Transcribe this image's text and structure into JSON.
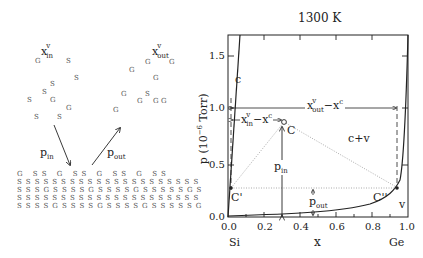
{
  "left_panel": {
    "x_in_label": {
      "base": "x",
      "sup": "v",
      "sub": "in"
    },
    "x_out_label": {
      "base": "x",
      "sup": "v",
      "sub": "out"
    },
    "p_in_label": {
      "base": "p",
      "sub": "in"
    },
    "p_out_label": {
      "base": "p",
      "sub": "out"
    },
    "vapor_in_atoms": [
      {
        "t": "G",
        "x": 35,
        "y": 57
      },
      {
        "t": "S",
        "x": 66,
        "y": 57
      },
      {
        "t": "S",
        "x": 74,
        "y": 74
      },
      {
        "t": "S",
        "x": 50,
        "y": 80
      },
      {
        "t": "S",
        "x": 42,
        "y": 88
      },
      {
        "t": "S",
        "x": 27,
        "y": 96
      },
      {
        "t": "G",
        "x": 50,
        "y": 96
      },
      {
        "t": "G",
        "x": 66,
        "y": 104
      },
      {
        "t": "S",
        "x": 34,
        "y": 113
      },
      {
        "t": "S",
        "x": 57,
        "y": 113
      }
    ],
    "vapor_out_atoms": [
      {
        "t": "G",
        "x": 145,
        "y": 58
      },
      {
        "t": "G",
        "x": 169,
        "y": 58
      },
      {
        "t": "G",
        "x": 129,
        "y": 66
      },
      {
        "t": "G",
        "x": 153,
        "y": 74
      },
      {
        "t": "G",
        "x": 121,
        "y": 90
      },
      {
        "t": "S",
        "x": 145,
        "y": 90
      },
      {
        "t": "G",
        "x": 137,
        "y": 97
      },
      {
        "t": "G",
        "x": 153,
        "y": 97
      },
      {
        "t": "G",
        "x": 161,
        "y": 97
      },
      {
        "t": "G",
        "x": 113,
        "y": 106
      }
    ],
    "lattice_rows": [
      "G   S S   G   S S   G   S S   G   S S",
      "S S S S S S S S S S S S S S S S S S S S S",
      "S S S G S S S S G S S S S G S S S S S G S",
      "S S S S S S S S S S S S S S S S S S S S S",
      "S S S S G S S S S G S S S S G S S S S S G"
    ]
  },
  "chart_data": {
    "type": "line",
    "title": "1300 K",
    "xlabel": "x",
    "ylabel": "p (10⁻⁶ Torr)",
    "xlim": [
      0.0,
      1.0
    ],
    "ylim": [
      0.0,
      1.7
    ],
    "x_ticks": [
      "0.0",
      "0.2",
      "0.4",
      "0.6",
      "0.8",
      "1.0"
    ],
    "y_ticks": [
      "0.0",
      "0.5",
      "1.0",
      "1.5"
    ],
    "x_end_labels": {
      "left": "Si",
      "right": "Ge"
    },
    "series": [
      {
        "name": "c (solidus)",
        "points": [
          [
            0.0,
            0.0
          ],
          [
            0.02,
            0.5
          ],
          [
            0.04,
            1.0
          ],
          [
            0.065,
            1.7
          ]
        ]
      },
      {
        "name": "v (vapor curve)",
        "points": [
          [
            0.0,
            0.0
          ],
          [
            0.3,
            0.03
          ],
          [
            0.6,
            0.07
          ],
          [
            0.8,
            0.12
          ],
          [
            0.9,
            0.18
          ],
          [
            0.96,
            0.28
          ],
          [
            0.98,
            0.55
          ],
          [
            0.99,
            1.0
          ],
          [
            1.0,
            1.7
          ]
        ]
      }
    ],
    "points": [
      {
        "name": "C",
        "x": 0.3,
        "y": 0.9
      },
      {
        "name": "C'",
        "x": 0.01,
        "y": 0.26
      },
      {
        "name": "C''",
        "x": 0.96,
        "y": 0.26
      }
    ],
    "annotations": [
      {
        "text": "c",
        "region": "left of solidus"
      },
      {
        "text": "c+v",
        "region": "two-phase"
      },
      {
        "text": "v",
        "region": "vapor"
      },
      {
        "text": "x_out^v − x^c",
        "type": "double-arrow",
        "y": 1.0
      },
      {
        "text": "x_in^v − x^c",
        "type": "double-arrow",
        "y": 0.9
      },
      {
        "text": "p_in",
        "type": "arrow",
        "x": 0.3
      },
      {
        "text": "p_out",
        "type": "arrow",
        "x": 0.48
      }
    ],
    "grid": false
  },
  "plot_labels": {
    "title": "1300 K",
    "y_axis_label": "p (10",
    "y_axis_exp": "−6",
    "y_axis_unit": " Torr)",
    "x_axis_label": "x",
    "si": "Si",
    "ge": "Ge",
    "x_ticks": [
      "0.0",
      "0.2",
      "0.4",
      "0.6",
      "0.8",
      "1.0"
    ],
    "y_ticks": [
      "0.0",
      "0.5",
      "1.0",
      "1.5"
    ],
    "region_c": "c",
    "region_cv": "c+v",
    "region_v": "v",
    "point_c": "C",
    "point_c1": "C'",
    "point_c2": "C''",
    "x_out_diff": {
      "base": "x",
      "sup": "v",
      "sub": "out",
      "rest": "−x",
      "rest_sup": "c"
    },
    "x_in_diff": {
      "base": "x",
      "sup": "v",
      "sub": "in",
      "rest": "−x",
      "rest_sup": "c"
    },
    "p_in": {
      "base": "p",
      "sub": "in"
    },
    "p_out": {
      "base": "p",
      "sub": "out"
    }
  }
}
